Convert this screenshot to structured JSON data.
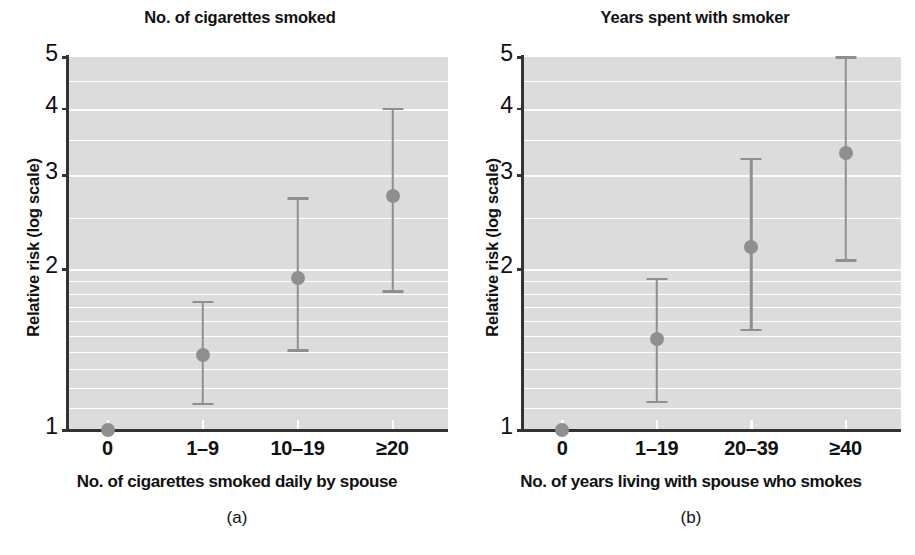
{
  "figure": {
    "caption_a": "(a)",
    "caption_b": "(b)"
  },
  "chart_data": [
    {
      "type": "scatter",
      "panel": "a",
      "title": "No. of cigarettes smoked",
      "xlabel": "No. of cigarettes smoked daily by spouse",
      "ylabel": "Relative risk (log scale)",
      "yscale": "log",
      "ylim": [
        1,
        5
      ],
      "yticks": [
        1,
        2,
        3,
        4,
        5
      ],
      "ytick_labels": [
        "1",
        "2",
        "3",
        "4",
        "5"
      ],
      "minor_gridlines": [
        1.1,
        1.2,
        1.3,
        1.4,
        1.5,
        1.6,
        1.7,
        1.8,
        1.9,
        2.5,
        3.5,
        4.5
      ],
      "grid": true,
      "legend": "none",
      "categories": [
        "0",
        "1–9",
        "10–19",
        "≥20"
      ],
      "values": [
        1.0,
        1.38,
        1.93,
        2.75
      ],
      "ci_lower": [
        1.0,
        1.12,
        1.41,
        1.82
      ],
      "ci_upper": [
        1.0,
        1.74,
        2.72,
        4.0
      ],
      "marker_color": "#8f8f8f",
      "plot_bg": "#dcdcdc"
    },
    {
      "type": "scatter",
      "panel": "b",
      "title": "Years spent with smoker",
      "xlabel": "No. of years living with spouse who smokes",
      "ylabel": "Relative risk (log scale)",
      "yscale": "log",
      "ylim": [
        1,
        5
      ],
      "yticks": [
        1,
        2,
        3,
        4,
        5
      ],
      "ytick_labels": [
        "1",
        "2",
        "3",
        "4",
        "5"
      ],
      "minor_gridlines": [
        1.1,
        1.2,
        1.3,
        1.4,
        1.5,
        1.6,
        1.7,
        1.8,
        1.9,
        2.5,
        3.5,
        4.5
      ],
      "grid": true,
      "legend": "none",
      "categories": [
        "0",
        "1–19",
        "20–39",
        "≥40"
      ],
      "values": [
        1.0,
        1.48,
        2.2,
        3.3
      ],
      "ci_lower": [
        1.0,
        1.13,
        1.54,
        2.08
      ],
      "ci_upper": [
        1.0,
        1.92,
        3.22,
        5.0
      ],
      "marker_color": "#8f8f8f",
      "plot_bg": "#dcdcdc"
    }
  ]
}
